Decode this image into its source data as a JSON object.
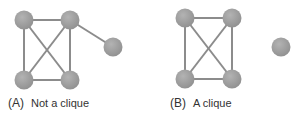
{
  "colors": {
    "node": "#9a9a9a",
    "node_highlight": "#b5b5b5",
    "edge": "#8c8c8c",
    "text": "#333333"
  },
  "panels": [
    {
      "id": "A",
      "letter": "(A)",
      "caption": "Not a clique",
      "nodes": [
        {
          "id": "a1",
          "x": 24,
          "y": 20
        },
        {
          "id": "a2",
          "x": 70,
          "y": 20
        },
        {
          "id": "a3",
          "x": 24,
          "y": 80
        },
        {
          "id": "a4",
          "x": 70,
          "y": 80
        },
        {
          "id": "a5",
          "x": 113,
          "y": 47
        }
      ],
      "edges": [
        [
          "a1",
          "a2"
        ],
        [
          "a1",
          "a3"
        ],
        [
          "a1",
          "a4"
        ],
        [
          "a2",
          "a3"
        ],
        [
          "a2",
          "a4"
        ],
        [
          "a3",
          "a4"
        ],
        [
          "a2",
          "a5"
        ]
      ]
    },
    {
      "id": "B",
      "letter": "(B)",
      "caption": "A clique",
      "nodes": [
        {
          "id": "b1",
          "x": 185,
          "y": 18
        },
        {
          "id": "b2",
          "x": 232,
          "y": 18
        },
        {
          "id": "b3",
          "x": 185,
          "y": 79
        },
        {
          "id": "b4",
          "x": 232,
          "y": 79
        },
        {
          "id": "b5",
          "x": 281,
          "y": 47
        }
      ],
      "edges": [
        [
          "b1",
          "b2"
        ],
        [
          "b1",
          "b3"
        ],
        [
          "b1",
          "b4"
        ],
        [
          "b2",
          "b3"
        ],
        [
          "b2",
          "b4"
        ],
        [
          "b3",
          "b4"
        ]
      ]
    }
  ]
}
